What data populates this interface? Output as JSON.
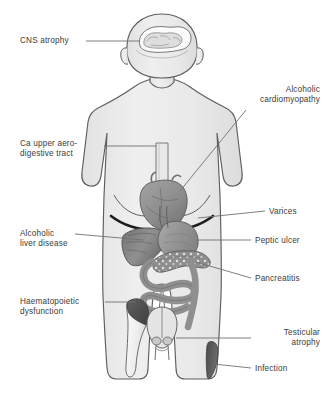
{
  "figure": {
    "background_color": "#ffffff",
    "body_fill": "#ececec",
    "outline_color": "#5a5a5a",
    "organ_gray": "#9a9a9a",
    "organ_dark": "#6f6f6f",
    "lesion_dark": "#555555",
    "leader_color": "#707070"
  },
  "labels": [
    {
      "id": "cns-atrophy",
      "text": "CNS atrophy",
      "align": "left",
      "x": 20,
      "y": 36,
      "width": 90
    },
    {
      "id": "ca-upper-aerodigestive",
      "text": "Ca upper aero-\ndigestive tract",
      "align": "left",
      "x": 20,
      "y": 139,
      "width": 95
    },
    {
      "id": "alcoholic-liver-disease",
      "text": "Alcoholic\nliver disease",
      "align": "left",
      "x": 20,
      "y": 229,
      "width": 90
    },
    {
      "id": "haematopoietic-dysfunction",
      "text": "Haematopoietic\ndysfunction",
      "align": "left",
      "x": 20,
      "y": 297,
      "width": 100
    },
    {
      "id": "alcoholic-cardiomyopathy",
      "text": "Alcoholic\ncardiomyopathy",
      "align": "rightal",
      "x": 225,
      "y": 85,
      "width": 95
    },
    {
      "id": "varices",
      "text": "Varices",
      "align": "right",
      "x": 269,
      "y": 207,
      "width": 55
    },
    {
      "id": "peptic-ulcer",
      "text": "Peptic ulcer",
      "align": "right",
      "x": 255,
      "y": 236,
      "width": 70
    },
    {
      "id": "pancreatitis",
      "text": "Pancreatitis",
      "align": "right",
      "x": 255,
      "y": 275,
      "width": 70
    },
    {
      "id": "testicular-atrophy",
      "text": "Testicular\natrophy",
      "align": "rightal",
      "x": 255,
      "y": 327,
      "width": 68
    },
    {
      "id": "infection",
      "text": "Infection",
      "align": "right",
      "x": 255,
      "y": 364,
      "width": 60
    }
  ],
  "organs": [
    {
      "id": "brain",
      "label": "brain with cortical atrophy"
    },
    {
      "id": "oesophagus",
      "label": "oesophagus"
    },
    {
      "id": "heart",
      "label": "heart"
    },
    {
      "id": "liver",
      "label": "liver"
    },
    {
      "id": "stomach",
      "label": "stomach"
    },
    {
      "id": "pancreas",
      "label": "pancreas"
    },
    {
      "id": "intestines",
      "label": "intestines"
    },
    {
      "id": "femur",
      "label": "femur with bone marrow"
    },
    {
      "id": "testes",
      "label": "testes"
    },
    {
      "id": "skin-lesion",
      "label": "skin lesion on thigh"
    }
  ]
}
